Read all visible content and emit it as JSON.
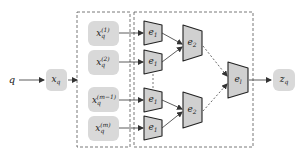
{
  "diagram": {
    "input_label": "q",
    "query_node": {
      "base": "x",
      "sub": "q"
    },
    "split_nodes": [
      {
        "base": "x",
        "sub": "q",
        "sup": "(1)"
      },
      {
        "base": "x",
        "sub": "q",
        "sup": "(2)"
      },
      {
        "base": "x",
        "sub": "q",
        "sup": "(m−1)"
      },
      {
        "base": "x",
        "sub": "q",
        "sup": "(m)"
      }
    ],
    "encoders_level1": [
      {
        "base": "e",
        "sub": "1"
      },
      {
        "base": "e",
        "sub": "1"
      },
      {
        "base": "e",
        "sub": "1"
      },
      {
        "base": "e",
        "sub": "1"
      }
    ],
    "encoders_level2": [
      {
        "base": "e",
        "sub": "2"
      },
      {
        "base": "e",
        "sub": "2"
      }
    ],
    "encoder_final": {
      "base": "e",
      "sub": "l"
    },
    "output_node": {
      "base": "z",
      "sub": "q"
    },
    "colors": {
      "node_fill": "#d9d9d9",
      "stroke": "#333333",
      "dash": "#555555"
    }
  }
}
